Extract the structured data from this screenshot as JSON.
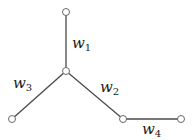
{
  "diagram": {
    "type": "weighted-tree",
    "nodes": [
      {
        "id": "top",
        "x": 66,
        "y": 12
      },
      {
        "id": "center",
        "x": 66,
        "y": 71
      },
      {
        "id": "left",
        "x": 12,
        "y": 119
      },
      {
        "id": "middle",
        "x": 123,
        "y": 119
      },
      {
        "id": "right",
        "x": 181,
        "y": 119
      }
    ],
    "edges": [
      {
        "from": "top",
        "to": "center",
        "label": {
          "base": "w",
          "sub": "1"
        }
      },
      {
        "from": "center",
        "to": "middle",
        "label": {
          "base": "w",
          "sub": "2"
        }
      },
      {
        "from": "center",
        "to": "left",
        "label": {
          "base": "w",
          "sub": "3"
        }
      },
      {
        "from": "middle",
        "to": "right",
        "label": {
          "base": "w",
          "sub": "4"
        }
      }
    ],
    "colors": {
      "edge": "#4a4a4a",
      "node_stroke": "#6a6a6a",
      "node_fill": "#ffffff",
      "text": "#1a1a1a"
    }
  }
}
